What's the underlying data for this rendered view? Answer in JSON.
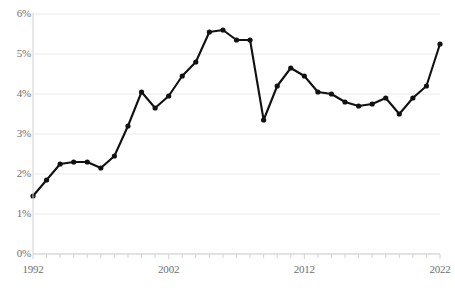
{
  "chart_data": {
    "type": "line",
    "title": "",
    "subtitle": "",
    "xlabel": "",
    "ylabel": "",
    "x": [
      1992,
      1993,
      1994,
      1995,
      1996,
      1997,
      1998,
      1999,
      2000,
      2001,
      2002,
      2003,
      2004,
      2005,
      2006,
      2007,
      2008,
      2009,
      2010,
      2011,
      2012,
      2013,
      2014,
      2015,
      2016,
      2017,
      2018,
      2019,
      2020,
      2021,
      2022
    ],
    "values": [
      1.45,
      1.85,
      2.25,
      2.3,
      2.3,
      2.15,
      2.45,
      3.2,
      4.05,
      3.65,
      3.95,
      4.45,
      4.8,
      5.55,
      5.6,
      5.35,
      5.35,
      3.35,
      4.2,
      4.65,
      4.45,
      4.05,
      4.0,
      3.8,
      3.7,
      3.75,
      3.9,
      3.5,
      3.9,
      4.2,
      5.25
    ],
    "series": [
      {
        "name": "",
        "values": [
          1.45,
          1.85,
          2.25,
          2.3,
          2.3,
          2.15,
          2.45,
          3.2,
          4.05,
          3.65,
          3.95,
          4.45,
          4.8,
          5.55,
          5.6,
          5.35,
          5.35,
          3.35,
          4.2,
          4.65,
          4.45,
          4.05,
          4.0,
          3.8,
          3.7,
          3.75,
          3.9,
          3.5,
          3.9,
          4.2,
          5.25
        ],
        "color": "#111111",
        "marker": "circle"
      }
    ],
    "xlim": [
      1992,
      2022
    ],
    "ylim": [
      0,
      6
    ],
    "y_ticks": [
      0,
      1,
      2,
      3,
      4,
      5,
      6
    ],
    "y_tick_labels": [
      "0%",
      "1%",
      "2%",
      "3%",
      "4%",
      "5%",
      "6%"
    ],
    "x_ticks": [
      1992,
      2002,
      2012,
      2022
    ],
    "x_tick_labels": [
      "1992",
      "2002",
      "2012",
      "2022"
    ],
    "x_minor_tick_interval": 1,
    "grid": "horizontal",
    "legend": "none",
    "annotations": []
  },
  "style": {
    "line_color": "#111111",
    "marker_color": "#111111",
    "gridline_color": "#e9e9e9",
    "axis_color": "#d2d2d2",
    "tick_label_color": "#6f6f6f",
    "background": "#ffffff"
  }
}
